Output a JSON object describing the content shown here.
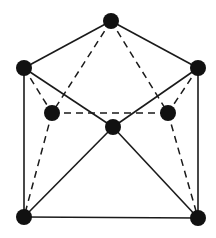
{
  "diagram": {
    "type": "graph",
    "width": 216,
    "height": 238,
    "colors": {
      "background": "#ffffff",
      "edge": "#1a1a1a",
      "node": "#111111"
    },
    "node_radius": 8,
    "nodes": [
      {
        "id": "top",
        "x": 111,
        "y": 21
      },
      {
        "id": "left-upper",
        "x": 24,
        "y": 68
      },
      {
        "id": "right-upper",
        "x": 198,
        "y": 68
      },
      {
        "id": "left-inner",
        "x": 52,
        "y": 113
      },
      {
        "id": "right-inner",
        "x": 168,
        "y": 113
      },
      {
        "id": "center",
        "x": 113,
        "y": 127
      },
      {
        "id": "bottom-left",
        "x": 24,
        "y": 217
      },
      {
        "id": "bottom-right",
        "x": 198,
        "y": 218
      }
    ],
    "edges": [
      {
        "from": "top",
        "to": "left-upper",
        "style": "solid"
      },
      {
        "from": "top",
        "to": "right-upper",
        "style": "solid"
      },
      {
        "from": "left-upper",
        "to": "bottom-left",
        "style": "solid"
      },
      {
        "from": "right-upper",
        "to": "bottom-right",
        "style": "solid"
      },
      {
        "from": "bottom-left",
        "to": "bottom-right",
        "style": "solid"
      },
      {
        "from": "left-upper",
        "to": "center",
        "style": "solid"
      },
      {
        "from": "right-upper",
        "to": "center",
        "style": "solid"
      },
      {
        "from": "center",
        "to": "bottom-left",
        "style": "solid"
      },
      {
        "from": "center",
        "to": "bottom-right",
        "style": "solid"
      },
      {
        "from": "top",
        "to": "left-inner",
        "style": "dashed"
      },
      {
        "from": "top",
        "to": "right-inner",
        "style": "dashed"
      },
      {
        "from": "left-upper",
        "to": "left-inner",
        "style": "dashed"
      },
      {
        "from": "right-upper",
        "to": "right-inner",
        "style": "dashed"
      },
      {
        "from": "left-inner",
        "to": "right-inner",
        "style": "dashed"
      },
      {
        "from": "left-inner",
        "to": "bottom-left",
        "style": "dashed"
      },
      {
        "from": "right-inner",
        "to": "bottom-right",
        "style": "dashed"
      }
    ]
  }
}
